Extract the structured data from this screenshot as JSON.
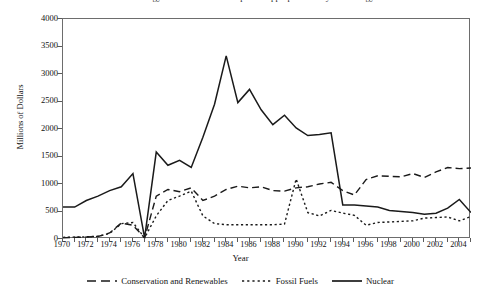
{
  "figure": {
    "title_partial": "Federal Energy Research and Development Appropriations by Technology",
    "background": "#ffffff"
  },
  "axes": {
    "ylabel": "Millions of Dollars",
    "xlabel": "Year",
    "yticks": [
      "0",
      "500",
      "1000",
      "1500",
      "2000",
      "2500",
      "3000",
      "3500",
      "4000"
    ],
    "xticks": [
      "1970",
      "1972",
      "1974",
      "1976",
      "1978",
      "1980",
      "1982",
      "1984",
      "1986",
      "1988",
      "1990",
      "1992",
      "1994",
      "1996",
      "1998",
      "2000",
      "2002",
      "2004"
    ]
  },
  "legend": {
    "items": [
      {
        "label": "Conservation and Renewables",
        "style": "dashed",
        "color": "#1a1a1a"
      },
      {
        "label": "Fossil Fuels",
        "style": "dotted",
        "color": "#1a1a1a"
      },
      {
        "label": "Nuclear",
        "style": "solid",
        "color": "#1a1a1a"
      }
    ]
  },
  "chart_data": {
    "type": "line",
    "title": "Federal Energy Research and Development Appropriations by Technology",
    "xlabel": "Year",
    "ylabel": "Millions of Dollars",
    "xlim": [
      1970,
      2005
    ],
    "ylim": [
      0,
      4000
    ],
    "ytick_step": 500,
    "xtick_step": 2,
    "grid": false,
    "legend_position": "bottom",
    "x": [
      1970,
      1971,
      1972,
      1973,
      1974,
      1975,
      1976,
      1977,
      1978,
      1979,
      1980,
      1981,
      1982,
      1983,
      1984,
      1985,
      1986,
      1987,
      1988,
      1989,
      1990,
      1991,
      1992,
      1993,
      1994,
      1995,
      1996,
      1997,
      1998,
      1999,
      2000,
      2001,
      2002,
      2003,
      2004,
      2005
    ],
    "series": [
      {
        "name": "Conservation and Renewables",
        "style": "dashed",
        "color": "#1a1a1a",
        "values": [
          20,
          30,
          35,
          45,
          110,
          290,
          250,
          20,
          780,
          900,
          860,
          930,
          700,
          780,
          900,
          960,
          930,
          950,
          880,
          870,
          930,
          950,
          1000,
          1030,
          880,
          800,
          1080,
          1150,
          1140,
          1130,
          1190,
          1120,
          1220,
          1300,
          1280,
          1290
        ]
      },
      {
        "name": "Fossil Fuels",
        "style": "dotted",
        "color": "#1a1a1a",
        "values": [
          30,
          35,
          40,
          50,
          100,
          280,
          300,
          20,
          420,
          700,
          780,
          870,
          420,
          280,
          260,
          260,
          260,
          260,
          260,
          270,
          1090,
          480,
          420,
          520,
          470,
          430,
          250,
          300,
          310,
          320,
          330,
          380,
          390,
          400,
          330,
          410
        ]
      },
      {
        "name": "Nuclear",
        "style": "solid",
        "color": "#1a1a1a",
        "values": [
          580,
          580,
          700,
          780,
          880,
          950,
          1190,
          20,
          1580,
          1340,
          1430,
          1300,
          1850,
          2450,
          3330,
          2480,
          2720,
          2350,
          2080,
          2250,
          2020,
          1880,
          1900,
          1930,
          620,
          620,
          600,
          580,
          520,
          500,
          480,
          450,
          470,
          560,
          720,
          480
        ]
      }
    ]
  }
}
